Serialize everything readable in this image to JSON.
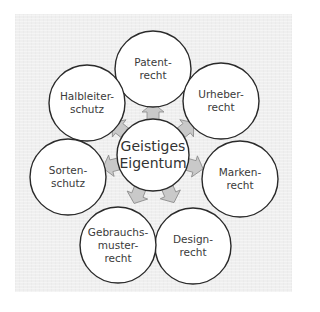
{
  "diagram": {
    "type": "radial",
    "center": {
      "id": "geistiges-eigentum",
      "lines": [
        "Geistiges",
        "Eigentum"
      ],
      "x": 153,
      "y": 155,
      "r": 36
    },
    "nodes": [
      {
        "id": "patentrecht",
        "lines": [
          "Patent-",
          "recht"
        ],
        "x": 153,
        "y": 69,
        "r": 38
      },
      {
        "id": "urheberrecht",
        "lines": [
          "Urheber-",
          "recht"
        ],
        "x": 221,
        "y": 101,
        "r": 38
      },
      {
        "id": "markenrecht",
        "lines": [
          "Marken-",
          "recht"
        ],
        "x": 240,
        "y": 179,
        "r": 38
      },
      {
        "id": "designrecht",
        "lines": [
          "Design-",
          "recht"
        ],
        "x": 193,
        "y": 246,
        "r": 38
      },
      {
        "id": "gebrauchsmusterrecht",
        "lines": [
          "Gebrauchs-",
          "muster-",
          "recht"
        ],
        "x": 118,
        "y": 245,
        "r": 38
      },
      {
        "id": "sortenschutz",
        "lines": [
          "Sorten-",
          "schutz"
        ],
        "x": 68,
        "y": 177,
        "r": 38
      },
      {
        "id": "halbleiterschutz",
        "lines": [
          "Halbleiter-",
          "schutz"
        ],
        "x": 87,
        "y": 103,
        "r": 38
      }
    ],
    "colors": {
      "background": "#efefef",
      "circle_fill": "#ffffff",
      "circle_stroke": "#2a2a2a",
      "arrow_fill": "#c9c9c9",
      "arrow_stroke": "#8a8a8a",
      "text": "#3a3a3a"
    }
  }
}
